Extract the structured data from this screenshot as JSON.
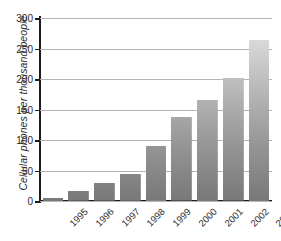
{
  "chart_data": {
    "type": "bar",
    "title": "",
    "xlabel": "",
    "ylabel": "Cellular phones per thousand people",
    "categories": [
      "1995",
      "1996",
      "1997",
      "1998",
      "1999",
      "2000",
      "2001",
      "2002",
      "2003"
    ],
    "values": [
      5,
      16,
      29,
      44,
      90,
      137,
      166,
      201,
      264
    ],
    "ylim": [
      0,
      300
    ],
    "yticks": [
      0,
      50,
      100,
      150,
      200,
      250,
      300
    ],
    "ytick_labels": [
      "0",
      "50",
      "100",
      "150",
      "200",
      "250",
      "300"
    ],
    "grid": true,
    "legend": false,
    "bar_color_top": "#e8e8e8",
    "bar_color_bottom": "#787878",
    "axis_color": "#1c1c1c",
    "gridline_color": "#b4b4b4"
  }
}
